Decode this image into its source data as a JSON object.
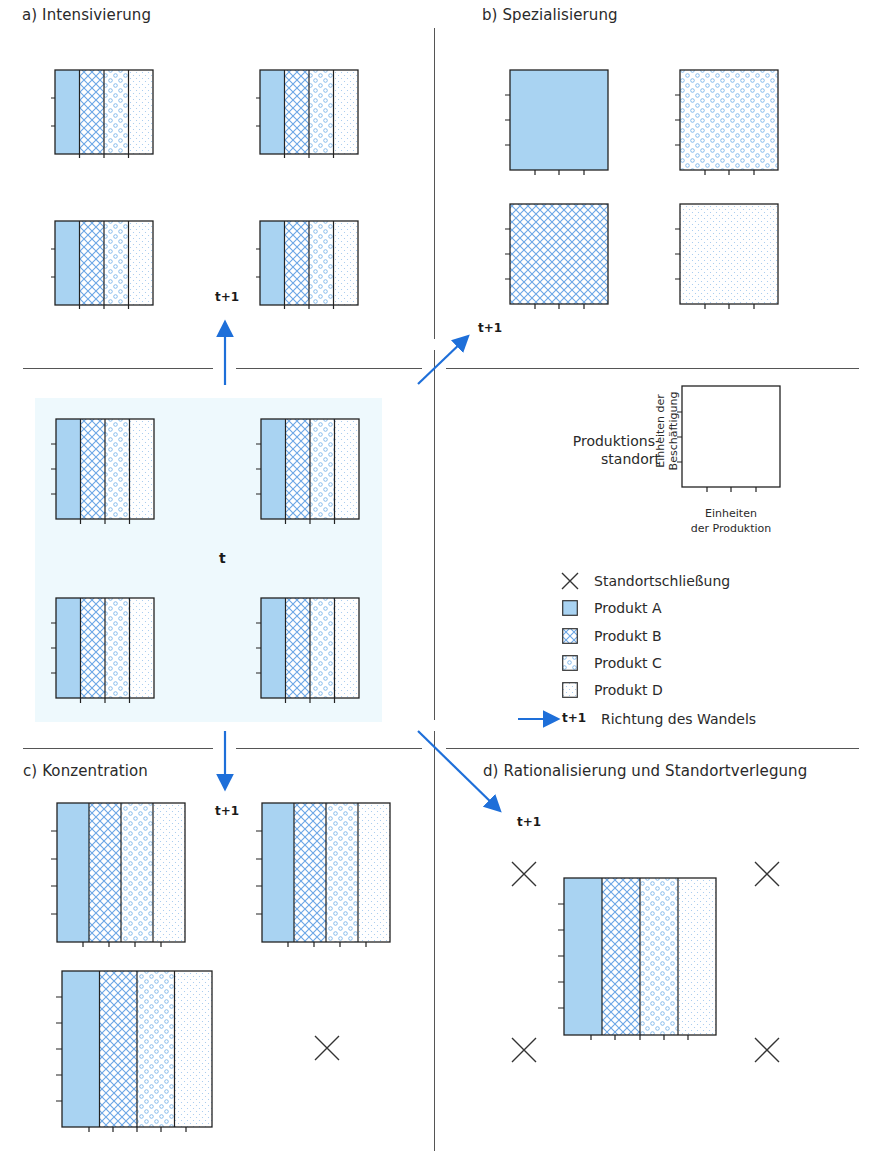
{
  "panels": {
    "a": {
      "title": "a) Intensivierung",
      "time_label": "t+1"
    },
    "b": {
      "title": "b) Spezialisierung",
      "time_label": "t+1"
    },
    "c": {
      "title": "c) Konzentration",
      "time_label": "t+1"
    },
    "d": {
      "title": "d) Rationalisierung und Standortverlegung",
      "time_label": "t+1"
    },
    "center": {
      "time_label": "t"
    }
  },
  "key": {
    "site_label_line1": "Produktions-",
    "site_label_line2": "standort",
    "y_axis_line1": "Einheiten der",
    "y_axis_line2": "Beschäftigung",
    "x_axis_line1": "Einheiten",
    "x_axis_line2": "der Produktion"
  },
  "legend": {
    "items": [
      {
        "symbol": "x-mark",
        "label": "Standortschließung"
      },
      {
        "symbol": "solid",
        "label": "Produkt A"
      },
      {
        "symbol": "crosshatch",
        "label": "Produkt B"
      },
      {
        "symbol": "circles",
        "label": "Produkt C"
      },
      {
        "symbol": "dots",
        "label": "Produkt D"
      }
    ],
    "arrow_time_label": "t+1",
    "arrow_label": "Richtung des Wandels"
  },
  "colors": {
    "product_a_fill": "#a9d3f2",
    "pattern_blue": "#6aa6e6",
    "arrow_blue": "#1e6fd9",
    "center_background": "#eef9fd",
    "outline": "#222222"
  }
}
